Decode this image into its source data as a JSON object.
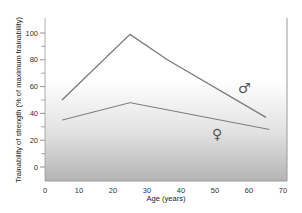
{
  "chart_data": {
    "type": "line",
    "title": "",
    "xlabel": "Age (years)",
    "ylabel": "Trainability of strength (% of maximum trainability)",
    "xlim": [
      0,
      70
    ],
    "ylim": [
      -10,
      112
    ],
    "xticks": [
      0,
      10,
      20,
      30,
      40,
      50,
      60,
      70
    ],
    "yticks_labeled": [
      0,
      20,
      40,
      60,
      80,
      100
    ],
    "yticks_minor": [
      10,
      30,
      50,
      70,
      90
    ],
    "grid": false,
    "legend": "inline symbols",
    "series": [
      {
        "name": "Male (♂)",
        "x": [
          5,
          25,
          36,
          65
        ],
        "y": [
          50,
          99,
          80,
          37
        ]
      },
      {
        "name": "Female (♀)",
        "x": [
          5,
          25,
          66
        ],
        "y": [
          35,
          48,
          28
        ]
      }
    ],
    "annotations": [
      {
        "text": "♂",
        "x": 60,
        "y": 58
      },
      {
        "text": "♀",
        "x": 52,
        "y": 23
      }
    ]
  },
  "labels": {
    "xlabel": "Age (years)",
    "ylabel": "Trainability of strength (% of maximum trainability)",
    "male_symbol": "♂",
    "female_symbol": "♀",
    "xticks": [
      "0",
      "10",
      "20",
      "30",
      "40",
      "50",
      "60",
      "70"
    ],
    "yticks": [
      "0",
      "20",
      "40",
      "60",
      "80",
      "100"
    ]
  },
  "colors": {
    "line": "#7a7a7a",
    "gradient_top": "#ffffff",
    "gradient_bottom": "#b4b4b4",
    "axis": "#888888"
  }
}
